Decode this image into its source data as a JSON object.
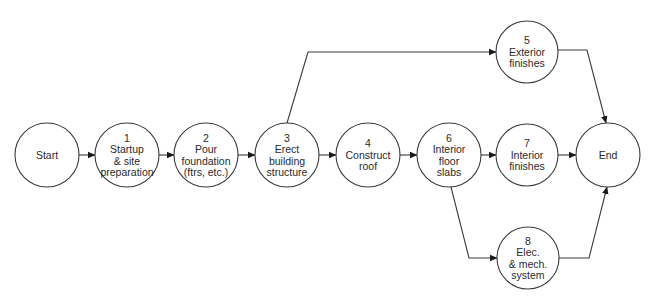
{
  "diagram": {
    "type": "activity-on-node network",
    "nodes": [
      {
        "id": "start",
        "lines": [
          "Start"
        ],
        "cx": 47,
        "cy": 155,
        "r": 32
      },
      {
        "id": "n1",
        "lines": [
          "1",
          "Startup",
          "& site",
          "preparation"
        ],
        "cx": 127,
        "cy": 155,
        "r": 32
      },
      {
        "id": "n2",
        "lines": [
          "2",
          "Pour",
          "foundation",
          "(ftrs, etc.)"
        ],
        "cx": 206,
        "cy": 155,
        "r": 32
      },
      {
        "id": "n3",
        "lines": [
          "3",
          "Erect",
          "building",
          "structure"
        ],
        "cx": 287,
        "cy": 155,
        "r": 32
      },
      {
        "id": "n4",
        "lines": [
          "4",
          "Construct",
          "roof"
        ],
        "cx": 368,
        "cy": 155,
        "r": 32
      },
      {
        "id": "n6",
        "lines": [
          "6",
          "Interior",
          "floor",
          "slabs"
        ],
        "cx": 449,
        "cy": 155,
        "r": 32
      },
      {
        "id": "n5",
        "lines": [
          "5",
          "Exterior",
          "finishes"
        ],
        "cx": 527,
        "cy": 52,
        "r": 31
      },
      {
        "id": "n7",
        "lines": [
          "7",
          "Interior",
          "finishes"
        ],
        "cx": 527,
        "cy": 155,
        "r": 31
      },
      {
        "id": "n8",
        "lines": [
          "8",
          "Elec.",
          "& mech.",
          "system"
        ],
        "cx": 528,
        "cy": 258,
        "r": 31
      },
      {
        "id": "end",
        "lines": [
          "End"
        ],
        "cx": 608,
        "cy": 155,
        "r": 32
      }
    ],
    "edges": [
      {
        "from": "start",
        "to": "n1",
        "points": [
          [
            79,
            155
          ],
          [
            95,
            155
          ]
        ]
      },
      {
        "from": "n1",
        "to": "n2",
        "points": [
          [
            159,
            155
          ],
          [
            174,
            155
          ]
        ]
      },
      {
        "from": "n2",
        "to": "n3",
        "points": [
          [
            238,
            155
          ],
          [
            255,
            155
          ]
        ]
      },
      {
        "from": "n3",
        "to": "n4",
        "points": [
          [
            319,
            155
          ],
          [
            336,
            155
          ]
        ]
      },
      {
        "from": "n4",
        "to": "n6",
        "points": [
          [
            400,
            155
          ],
          [
            417,
            155
          ]
        ]
      },
      {
        "from": "n3",
        "to": "n5",
        "points": [
          [
            287,
            123
          ],
          [
            308,
            52
          ],
          [
            496,
            52
          ]
        ]
      },
      {
        "from": "n6",
        "to": "n7",
        "points": [
          [
            481,
            155
          ],
          [
            496,
            155
          ]
        ]
      },
      {
        "from": "n6",
        "to": "n8",
        "points": [
          [
            451,
            187
          ],
          [
            469,
            258
          ],
          [
            497,
            258
          ]
        ]
      },
      {
        "from": "n5",
        "to": "end",
        "points": [
          [
            558,
            50
          ],
          [
            587,
            50
          ],
          [
            606,
            123
          ]
        ]
      },
      {
        "from": "n7",
        "to": "end",
        "points": [
          [
            558,
            155
          ],
          [
            576,
            155
          ]
        ]
      },
      {
        "from": "n8",
        "to": "end",
        "points": [
          [
            559,
            258
          ],
          [
            589,
            258
          ],
          [
            607,
            187
          ]
        ]
      }
    ]
  }
}
